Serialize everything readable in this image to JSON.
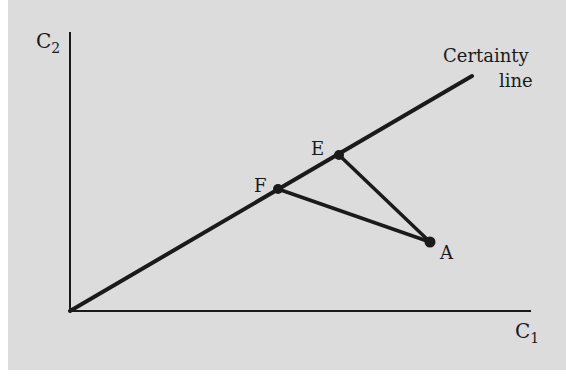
{
  "diagram": {
    "type": "economics-certainty-line",
    "axes": {
      "y_label_main": "C",
      "y_label_sub": "2",
      "x_label_main": "C",
      "x_label_sub": "1",
      "origin": [
        70,
        311
      ],
      "y_top": [
        70,
        32
      ],
      "x_right": [
        531,
        311
      ]
    },
    "certainty_line": {
      "label_line1": "Certainty",
      "label_line2": "line",
      "from": [
        70,
        311
      ],
      "to": [
        472,
        76
      ]
    },
    "points": [
      {
        "name": "E",
        "label": "E",
        "x": 339,
        "y": 155
      },
      {
        "name": "F",
        "label": "F",
        "x": 278,
        "y": 189
      },
      {
        "name": "A",
        "label": "A",
        "x": 430,
        "y": 242
      }
    ],
    "segments": [
      {
        "from": "E",
        "to": "A"
      },
      {
        "from": "F",
        "to": "A"
      }
    ],
    "colors": {
      "background": "#dcdcdc",
      "ink": "#1a1a1a"
    }
  }
}
